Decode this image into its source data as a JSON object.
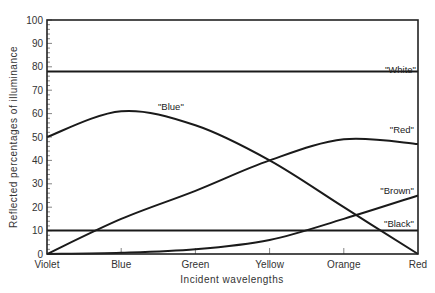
{
  "chart_data": {
    "type": "line",
    "title": "",
    "xlabel": "Incident wavelengths",
    "ylabel": "Reflected percentages of illuminance",
    "categories": [
      "Violet",
      "Blue",
      "Green",
      "Yellow",
      "Orange",
      "Red"
    ],
    "ylim": [
      0,
      100
    ],
    "yticks": [
      0,
      10,
      20,
      30,
      40,
      50,
      60,
      70,
      80,
      90,
      100
    ],
    "yticks_minor_step": 2,
    "grid": false,
    "series": [
      {
        "name": "\"White\"",
        "values": [
          78,
          78,
          78,
          78,
          78,
          78
        ]
      },
      {
        "name": "\"Blue\"",
        "values": [
          50,
          61,
          55,
          40,
          20,
          0
        ]
      },
      {
        "name": "\"Red\"",
        "values": [
          0,
          15,
          27,
          40,
          49,
          47
        ]
      },
      {
        "name": "\"Brown\"",
        "values": [
          0,
          0.5,
          2,
          6,
          15,
          25
        ]
      },
      {
        "name": "\"Black\"",
        "values": [
          10,
          10,
          10,
          10,
          10,
          10
        ]
      }
    ],
    "legend": "inline-labels"
  }
}
